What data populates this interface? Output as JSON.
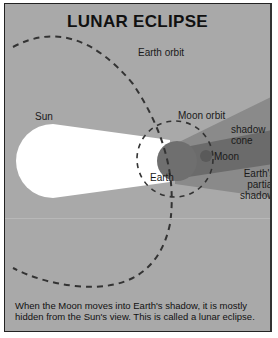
{
  "title": "LUNAR ECLIPSE",
  "labels": {
    "earth_orbit": "Earth orbit",
    "sun": "Sun",
    "moon_orbit": "Moon orbit",
    "shadow_cone_1": "shadow",
    "shadow_cone_2": "cone",
    "moon": "Moon",
    "earth": "Earth",
    "partial_1": "Earth's",
    "partial_2": "partial",
    "partial_3": "shadow"
  },
  "caption": "When the Moon moves into Earth's shadow, it is mostly hidden from the Sun's view. This is called a lunar eclipse.",
  "colors": {
    "background": "#a9a9a9",
    "sunlight": "#ffffff",
    "earth": "#6e6e6e",
    "shadow_cone": "#6a6a6a",
    "partial_shadow": "#888888",
    "orbit_dash": "#333333"
  }
}
